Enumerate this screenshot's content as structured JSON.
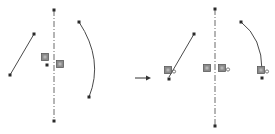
{
  "diagram": {
    "type": "cad-sketch-mirror-before-after",
    "colors": {
      "background": "#ffffff",
      "stroke": "#4a4a4a",
      "centerline": "#6a6a6a",
      "point": "#2a2a2a",
      "relation_icon_fill": "#8a8a8a",
      "relation_icon_border": "#5a5a5a",
      "arrow": "#333333"
    },
    "before": {
      "centerline": {
        "x": 54,
        "y1": 10,
        "y2": 121
      },
      "line": {
        "x1": 10,
        "y1": 75,
        "x2": 34,
        "y2": 34
      },
      "arc": {
        "x1": 79,
        "y1": 22,
        "cx": 104,
        "cy": 60,
        "x2": 89,
        "y2": 97
      },
      "relation_icons": [
        {
          "name": "midpoint-relation-icon",
          "x": 45,
          "y": 57,
          "badge": ""
        },
        {
          "name": "vertical-relation-icon",
          "x": 60,
          "y": 64,
          "badge": ""
        }
      ],
      "points": [
        {
          "x": 54,
          "y": 10
        },
        {
          "x": 54,
          "y": 121
        },
        {
          "x": 10,
          "y": 75
        },
        {
          "x": 34,
          "y": 34
        },
        {
          "x": 79,
          "y": 22
        },
        {
          "x": 89,
          "y": 97
        },
        {
          "x": 47,
          "y": 65
        }
      ]
    },
    "arrow": {
      "x1": 135,
      "y1": 78,
      "x2": 151,
      "y2": 78
    },
    "after": {
      "centerline": {
        "x": 215,
        "y1": 9,
        "y2": 126
      },
      "line": {
        "x1": 169,
        "y1": 77,
        "x2": 194,
        "y2": 34
      },
      "arc": {
        "x1": 241,
        "y1": 22,
        "cx": 262,
        "cy": 38,
        "x2": 262,
        "y2": 70
      },
      "relation_icons": [
        {
          "name": "coincident-relation-icon",
          "x": 168,
          "y": 70,
          "badge": "a"
        },
        {
          "name": "vertical-relation-icon",
          "x": 207,
          "y": 68,
          "badge": ""
        },
        {
          "name": "coincident-relation-icon",
          "x": 222,
          "y": 68,
          "badge": "a"
        },
        {
          "name": "coincident-relation-icon",
          "x": 261,
          "y": 70,
          "badge": "a"
        }
      ],
      "points": [
        {
          "x": 215,
          "y": 9
        },
        {
          "x": 215,
          "y": 126
        },
        {
          "x": 194,
          "y": 34
        },
        {
          "x": 169,
          "y": 79
        },
        {
          "x": 241,
          "y": 22
        },
        {
          "x": 262,
          "y": 78
        }
      ]
    }
  }
}
